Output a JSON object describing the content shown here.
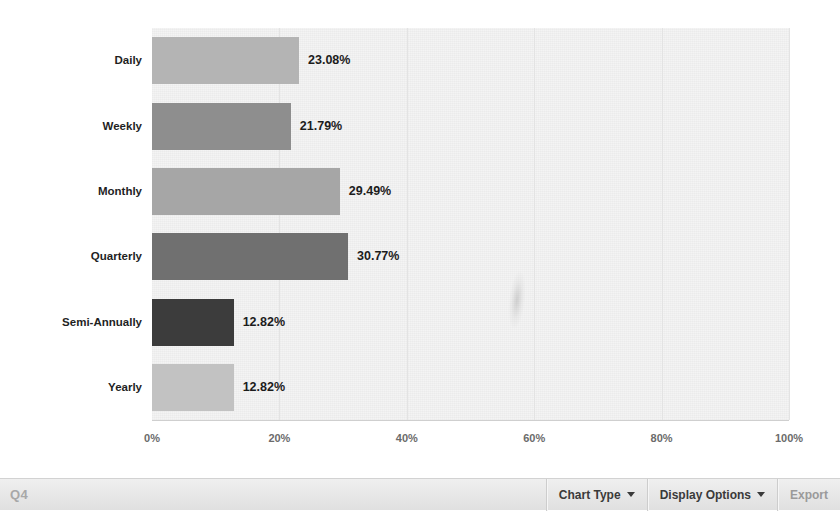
{
  "chart_data": {
    "type": "bar",
    "orientation": "horizontal",
    "title": "",
    "xlabel": "",
    "ylabel": "",
    "xlim": [
      0,
      100
    ],
    "grid": true,
    "legend": "none",
    "categories": [
      "Daily",
      "Weekly",
      "Monthly",
      "Quarterly",
      "Semi-Annually",
      "Yearly"
    ],
    "values": [
      23.08,
      21.79,
      29.49,
      30.77,
      12.82,
      12.82
    ],
    "value_labels": [
      "23.08%",
      "21.79%",
      "29.49%",
      "30.77%",
      "12.82%",
      "12.82%"
    ],
    "bar_colors": [
      "#b4b4b4",
      "#8e8e8e",
      "#a6a6a6",
      "#707070",
      "#3c3c3c",
      "#c2c2c2"
    ],
    "xticks": [
      0,
      20,
      40,
      60,
      80,
      100
    ],
    "xtick_labels": [
      "0%",
      "20%",
      "40%",
      "60%",
      "80%",
      "100%"
    ],
    "plot_background": "#f4f4f4",
    "gridline_color": "#e3e3e3"
  },
  "toolbar": {
    "quarter_label": "Q4",
    "chart_type_label": "Chart Type",
    "display_options_label": "Display Options",
    "export_label": "Export"
  }
}
